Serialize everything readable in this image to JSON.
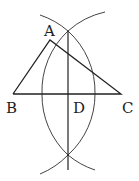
{
  "diagram": {
    "labels": {
      "A": "A",
      "B": "B",
      "C": "C",
      "D": "D"
    },
    "stroke_color": "#222222",
    "arc_color": "#444444"
  }
}
